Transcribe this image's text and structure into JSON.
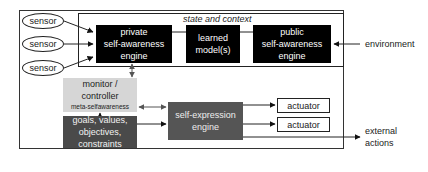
{
  "diagram": {
    "context_label": "state and context",
    "sensors": [
      {
        "label": "sensor"
      },
      {
        "label": "sensor"
      },
      {
        "label": "sensor"
      }
    ],
    "private_engine": {
      "lines": [
        "private",
        "self-awareness",
        "engine"
      ]
    },
    "learned_models": {
      "lines": [
        "learned",
        "model(s)"
      ]
    },
    "public_engine": {
      "lines": [
        "public",
        "self-awareness",
        "engine"
      ]
    },
    "environment_label": "environment",
    "monitor": {
      "lines": [
        "monitor /",
        "controller"
      ],
      "sub": "meta-selfawareness"
    },
    "goals": {
      "lines": [
        "goals, values,",
        "objectives,",
        "constraints"
      ]
    },
    "self_expression": {
      "lines": [
        "self-expression",
        "engine"
      ]
    },
    "actuators": [
      {
        "label": "actuator"
      },
      {
        "label": "actuator"
      }
    ],
    "external_actions": {
      "lines": [
        "external",
        "actions"
      ]
    },
    "colors": {
      "engine_black": "#000000",
      "monitor_gray": "#d6d6d6",
      "goals_dark": "#4a4a4a",
      "selfexp_gray": "#555555"
    }
  }
}
